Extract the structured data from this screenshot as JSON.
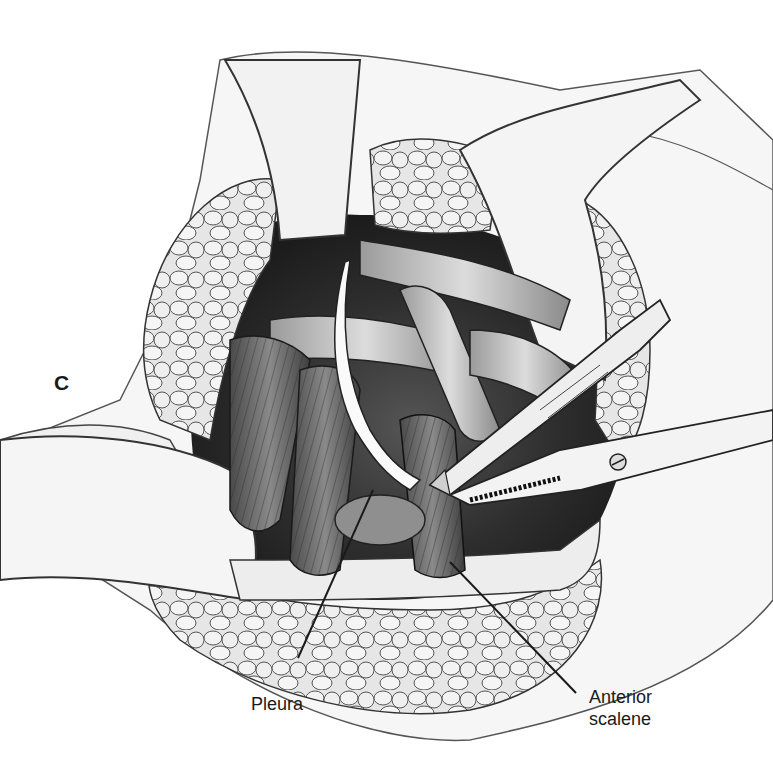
{
  "figure": {
    "panel_letter": "C",
    "colors": {
      "background": "#ffffff",
      "ink": "#1a1a1a",
      "skin": "#f4f4f4",
      "fat": "#d9d9d9",
      "deep": "#3a3a3a",
      "muscle": "#6e6e6e",
      "instrument": "#ececec"
    },
    "labels": {
      "pleura": "Pleura",
      "anterior_scalene_line1": "Anterior",
      "anterior_scalene_line2": "scalene"
    }
  }
}
